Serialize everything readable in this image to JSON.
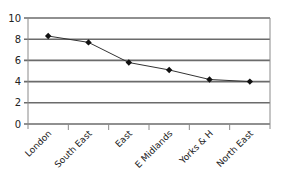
{
  "chart_data": {
    "type": "line",
    "title": "",
    "xlabel": "",
    "ylabel": "",
    "categories": [
      "London",
      "South East",
      "East",
      "E Midlands",
      "Yorks & H",
      "North East"
    ],
    "series": [
      {
        "name": "Series 1",
        "values": [
          8.3,
          7.7,
          5.8,
          5.1,
          4.2,
          4.0
        ],
        "color": "#333333",
        "marker": "diamond"
      }
    ],
    "ylim": [
      0,
      10
    ],
    "yticks": [
      0,
      2,
      4,
      6,
      8,
      10
    ],
    "grid": true,
    "legend": false
  }
}
